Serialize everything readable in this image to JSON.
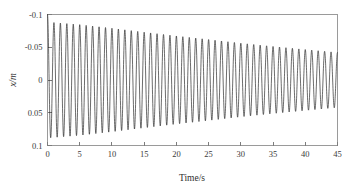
{
  "figure": {
    "background_color": "#ffffff",
    "line_color": "#1c1c1c",
    "axis_color": "#9a9a9a"
  },
  "axis_labels": {
    "x": "Time/s",
    "y_variable": "x",
    "y_unit": "/m",
    "y_full": "x/m"
  },
  "ticks": {
    "x": [
      "0",
      "5",
      "10",
      "15",
      "20",
      "25",
      "30",
      "35",
      "40",
      "45"
    ],
    "y": [
      "0.1",
      "0.05",
      "0",
      "-0.05",
      "-0.1"
    ]
  },
  "chart_data": {
    "type": "line",
    "title": "",
    "subtitle": "",
    "xlabel": "Time/s",
    "ylabel": "x/m",
    "xlim": [
      0,
      45
    ],
    "ylim": [
      -0.1,
      0.1
    ],
    "xticks": [
      0,
      5,
      10,
      15,
      20,
      25,
      30,
      35,
      40,
      45
    ],
    "yticks": [
      -0.1,
      -0.05,
      0,
      0.05,
      0.1
    ],
    "grid": false,
    "legend": null,
    "legend_position": "none",
    "annotations": [],
    "model": {
      "form": "x(t) = A(t) * cos(2*pi*f*t + phase)",
      "initial_value": 0.1,
      "amplitude_start": 0.088,
      "amplitude_end": 0.042,
      "amplitude_decay": "exponential",
      "damping_ratio_estimate": 0.0026,
      "frequency_hz": 1.0,
      "phase_rad": 0.0,
      "samples_per_second": 60
    },
    "series": [
      {
        "name": "x(t)",
        "color": "#1c1c1c",
        "amplitude_envelope": [
          {
            "t": 0,
            "amplitude": 0.0885
          },
          {
            "t": 5,
            "amplitude": 0.0845
          },
          {
            "t": 10,
            "amplitude": 0.079
          },
          {
            "t": 15,
            "amplitude": 0.073
          },
          {
            "t": 20,
            "amplitude": 0.0672
          },
          {
            "t": 25,
            "amplitude": 0.0618
          },
          {
            "t": 30,
            "amplitude": 0.0562
          },
          {
            "t": 35,
            "amplitude": 0.0512
          },
          {
            "t": 40,
            "amplitude": 0.0465
          },
          {
            "t": 45,
            "amplitude": 0.042
          }
        ],
        "peaks": [
          {
            "t": 0.0,
            "x": 0.1
          },
          {
            "t": 1.0,
            "x": 0.088
          },
          {
            "t": 2.0,
            "x": 0.0869
          },
          {
            "t": 3.0,
            "x": 0.0858
          },
          {
            "t": 4.0,
            "x": 0.0847
          },
          {
            "t": 5.0,
            "x": 0.0836
          },
          {
            "t": 6.0,
            "x": 0.0825
          },
          {
            "t": 7.0,
            "x": 0.0814
          },
          {
            "t": 8.0,
            "x": 0.0803
          },
          {
            "t": 9.0,
            "x": 0.0793
          },
          {
            "t": 10.0,
            "x": 0.0782
          },
          {
            "t": 11.0,
            "x": 0.076
          },
          {
            "t": 12.0,
            "x": 0.0748
          },
          {
            "t": 13.0,
            "x": 0.0737
          },
          {
            "t": 14.0,
            "x": 0.0726
          },
          {
            "t": 15.0,
            "x": 0.0715
          },
          {
            "t": 16.0,
            "x": 0.0703
          },
          {
            "t": 17.0,
            "x": 0.0692
          },
          {
            "t": 18.0,
            "x": 0.0681
          },
          {
            "t": 19.0,
            "x": 0.067
          },
          {
            "t": 20.0,
            "x": 0.0659
          },
          {
            "t": 21.0,
            "x": 0.0648
          },
          {
            "t": 22.0,
            "x": 0.0637
          },
          {
            "t": 23.0,
            "x": 0.0626
          },
          {
            "t": 24.0,
            "x": 0.0615
          },
          {
            "t": 25.0,
            "x": 0.0604
          },
          {
            "t": 26.0,
            "x": 0.0593
          },
          {
            "t": 27.0,
            "x": 0.0582
          },
          {
            "t": 28.0,
            "x": 0.0571
          },
          {
            "t": 29.0,
            "x": 0.056
          },
          {
            "t": 30.0,
            "x": 0.055
          },
          {
            "t": 31.0,
            "x": 0.0539
          },
          {
            "t": 32.0,
            "x": 0.0529
          },
          {
            "t": 33.0,
            "x": 0.0518
          },
          {
            "t": 34.0,
            "x": 0.0508
          },
          {
            "t": 35.0,
            "x": 0.0498
          },
          {
            "t": 36.0,
            "x": 0.0488
          },
          {
            "t": 37.0,
            "x": 0.0478
          },
          {
            "t": 38.0,
            "x": 0.0468
          },
          {
            "t": 39.0,
            "x": 0.0459
          },
          {
            "t": 40.0,
            "x": 0.045
          },
          {
            "t": 41.0,
            "x": 0.0441
          },
          {
            "t": 42.0,
            "x": 0.0432
          },
          {
            "t": 43.0,
            "x": 0.0424
          },
          {
            "t": 44.0,
            "x": 0.0416
          },
          {
            "t": 45.0,
            "x": 0.0408
          }
        ],
        "troughs": [
          {
            "t": 0.5,
            "x": -0.088
          },
          {
            "t": 5.5,
            "x": -0.0831
          },
          {
            "t": 10.5,
            "x": -0.0776
          },
          {
            "t": 15.5,
            "x": -0.0709
          },
          {
            "t": 20.5,
            "x": -0.0653
          },
          {
            "t": 25.5,
            "x": -0.0599
          },
          {
            "t": 30.5,
            "x": -0.0544
          },
          {
            "t": 35.5,
            "x": -0.0493
          },
          {
            "t": 40.5,
            "x": -0.0445
          },
          {
            "t": 44.8,
            "x": -0.041
          }
        ]
      }
    ]
  }
}
